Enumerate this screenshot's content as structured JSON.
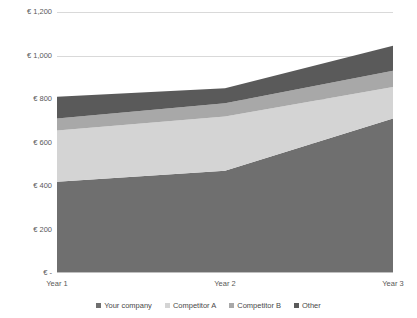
{
  "chart_data": {
    "type": "area",
    "stacked": true,
    "title": "Market share overview",
    "xlabel": "",
    "ylabel": "",
    "categories": [
      "Year 1",
      "Year 2",
      "Year 3"
    ],
    "ylim": [
      0,
      1200
    ],
    "yticks": [
      0,
      200,
      400,
      600,
      800,
      1000,
      1200
    ],
    "ytick_labels": [
      "€ -",
      "€ 200",
      "€ 400",
      "€ 600",
      "€ 800",
      "€ 1,000",
      "€ 1,200"
    ],
    "grid": true,
    "legend_position": "bottom",
    "currency_symbol": "€",
    "series": [
      {
        "name": "Your company",
        "values": [
          420,
          470,
          710
        ],
        "color": "#6f6f6f"
      },
      {
        "name": "Competitor A",
        "values": [
          235,
          250,
          145
        ],
        "color": "#d4d4d4"
      },
      {
        "name": "Competitor B",
        "values": [
          55,
          60,
          75
        ],
        "color": "#a8a8a8"
      },
      {
        "name": "Other",
        "values": [
          100,
          70,
          115
        ],
        "color": "#5a5a5a"
      }
    ],
    "totals": [
      810,
      850,
      1045
    ]
  },
  "axis": {
    "y_labels": [
      {
        "text": "€ 1,200",
        "value": 1200
      },
      {
        "text": "€ 1,000",
        "value": 1000
      },
      {
        "text": "€ 800",
        "value": 800
      },
      {
        "text": "€ 600",
        "value": 600
      },
      {
        "text": "€ 400",
        "value": 400
      },
      {
        "text": "€ 200",
        "value": 200
      },
      {
        "text": "€ -",
        "value": 0
      }
    ],
    "x_labels": [
      "Year 1",
      "Year 2",
      "Year 3"
    ]
  },
  "legend": {
    "items": [
      {
        "label": "Your company",
        "color": "#6f6f6f"
      },
      {
        "label": "Competitor A",
        "color": "#d4d4d4"
      },
      {
        "label": "Competitor B",
        "color": "#a8a8a8"
      },
      {
        "label": "Other",
        "color": "#5a5a5a"
      }
    ]
  }
}
